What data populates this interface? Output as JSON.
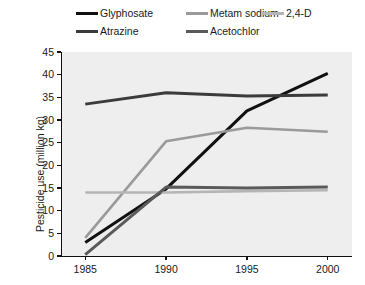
{
  "chart_data": {
    "type": "line",
    "title": "",
    "xlabel": "",
    "ylabel": "Pesticide use (million kg)",
    "x": [
      1985,
      1990,
      1995,
      2000
    ],
    "categories": [
      "1985",
      "1990",
      "1995",
      "2000"
    ],
    "xlim": [
      1983.5,
      2001.5
    ],
    "ylim": [
      0,
      45
    ],
    "ytick_values": [
      0,
      5,
      10,
      15,
      20,
      25,
      30,
      35,
      40,
      45
    ],
    "ytick_labels": [
      "0",
      "5",
      "10",
      "15",
      "20",
      "25",
      "30",
      "35",
      "40",
      "45"
    ],
    "xtick_labels": [
      "1985",
      "1990",
      "1995",
      "2000"
    ],
    "grid": false,
    "legend_position": "top",
    "plot_background": "#eeeeee",
    "series": [
      {
        "name": "Glyphosate",
        "color": "#111111",
        "width": 3.0,
        "values": [
          3.0,
          14.8,
          32.0,
          40.3
        ]
      },
      {
        "name": "Metam sodium",
        "color": "#9a9a9a",
        "width": 2.6,
        "values": [
          4.0,
          25.3,
          28.3,
          27.4
        ]
      },
      {
        "name": "2,4-D",
        "color": "#b5b5b5",
        "width": 2.6,
        "values": [
          14.0,
          14.0,
          14.3,
          14.5
        ]
      },
      {
        "name": "Atrazine",
        "color": "#3b3b3b",
        "width": 3.0,
        "values": [
          33.5,
          36.0,
          35.3,
          35.5
        ]
      },
      {
        "name": "Acetochlor",
        "color": "#5a5a5a",
        "width": 3.0,
        "values": [
          0.3,
          15.2,
          15.0,
          15.2
        ]
      }
    ]
  },
  "legend": {
    "items": [
      {
        "label": "Glyphosate"
      },
      {
        "label": "Metam sodium"
      },
      {
        "label": "2,4-D"
      },
      {
        "label": "Atrazine"
      },
      {
        "label": "Acetochlor"
      }
    ]
  },
  "axes": {
    "y_title": "Pesticide use (million kg)"
  }
}
